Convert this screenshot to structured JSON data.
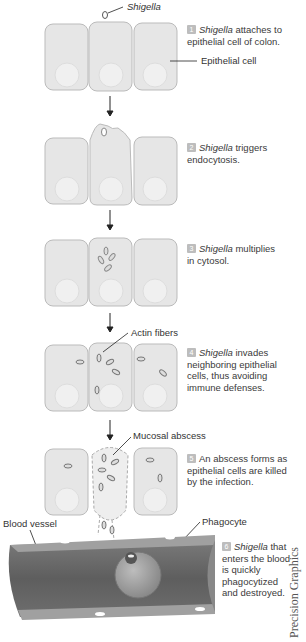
{
  "labels": {
    "shigella": "Shigella",
    "epithelial_cell": "Epithelial cell",
    "actin_fibers": "Actin fibers",
    "mucosal_abscess": "Mucosal abscess",
    "blood_vessel": "Blood vessel",
    "phagocyte": "Phagocyte"
  },
  "steps": [
    {
      "num": "1",
      "italic": "Shigella",
      "line1": " attaches to",
      "line2": "epithelial cell of colon."
    },
    {
      "num": "2",
      "italic": "Shigella",
      "line1": " triggers",
      "line2": "endocytosis."
    },
    {
      "num": "3",
      "italic": "Shigella",
      "line1": " multiplies",
      "line2": "in cytosol."
    },
    {
      "num": "4",
      "italic": "Shigella",
      "line1": " invades",
      "line2": "neighboring epithelial",
      "line3": "cells, thus avoiding",
      "line4": "immune defenses."
    },
    {
      "num": "5",
      "italic": "",
      "line1": "An abscess forms as",
      "line2": "epithelial cells are killed",
      "line3": "by the infection."
    },
    {
      "num": "6",
      "italic": "Shigella",
      "line1": " that",
      "line2": "enters the blood",
      "line3": "is quickly",
      "line4": "phagocytized",
      "line5": "and destroyed."
    }
  ],
  "credit": "Precision Graphics",
  "colors": {
    "cell_fill": "#e6e6e6",
    "cell_stroke": "#bbbbbb",
    "vessel_dark": "#6a6a6a",
    "badge": "#bdbdbd"
  }
}
